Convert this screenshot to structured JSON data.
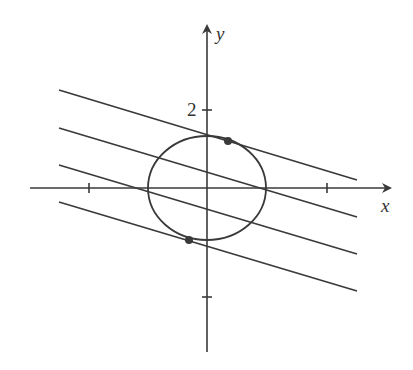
{
  "diagram": {
    "type": "ellipse-with-parallel-lines",
    "colors": {
      "stroke": "#3a3a3a",
      "background": "#ffffff",
      "dot": "#3a3a3a"
    },
    "axes": {
      "x_label": "x",
      "y_label": "y",
      "y_tick_label": "2"
    },
    "ellipse": {
      "cx": 207,
      "cy": 188,
      "rx": 59,
      "ry": 52
    },
    "lines": [
      {
        "x1": 59,
        "y1": 90,
        "x2": 357,
        "y2": 180
      },
      {
        "x1": 59,
        "y1": 128,
        "x2": 357,
        "y2": 217
      },
      {
        "x1": 59,
        "y1": 165,
        "x2": 357,
        "y2": 254
      },
      {
        "x1": 59,
        "y1": 202,
        "x2": 357,
        "y2": 291
      }
    ],
    "tangent_points": [
      {
        "cx": 228,
        "cy": 141
      },
      {
        "cx": 189,
        "cy": 240
      }
    ]
  }
}
